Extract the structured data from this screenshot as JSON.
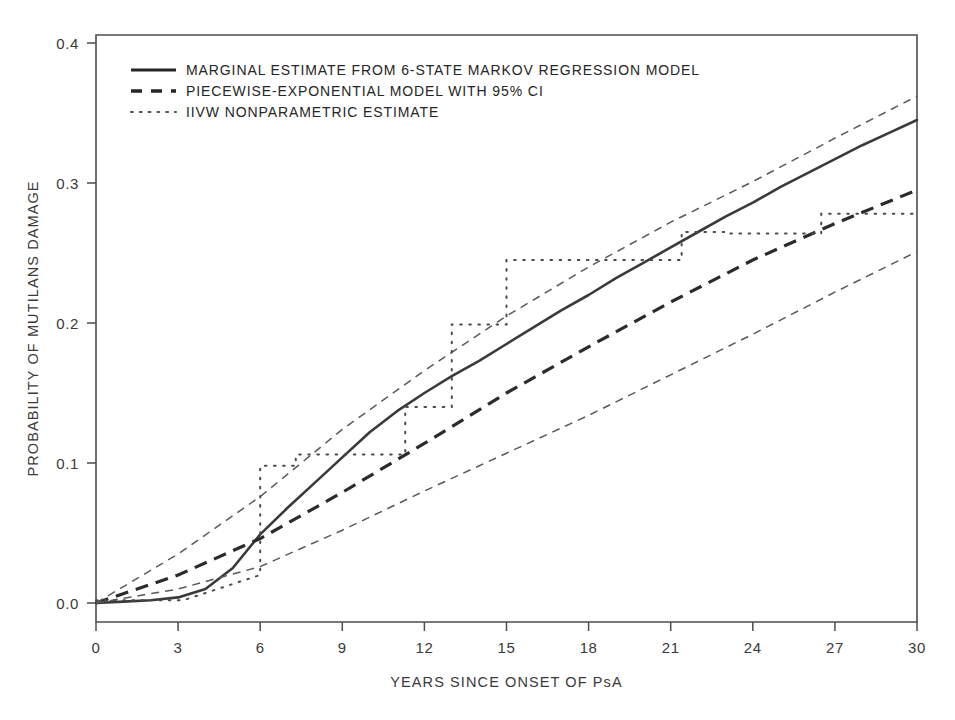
{
  "figure": {
    "background": "#ffffff",
    "frame_color": "#4d4d4d"
  },
  "chart_data": {
    "type": "line",
    "title": "",
    "xlabel": "YEARS SINCE ONSET OF PsA",
    "ylabel": "PROBABILITY OF MUTILANS DAMAGE",
    "xlim": [
      0,
      30
    ],
    "ylim": [
      0.0,
      0.4
    ],
    "xticks": [
      0,
      3,
      6,
      9,
      12,
      15,
      18,
      21,
      24,
      27,
      30
    ],
    "xticklabels": [
      "0",
      "3",
      "6",
      "9",
      "12",
      "15",
      "18",
      "21",
      "24",
      "27",
      "30"
    ],
    "yticks": [
      0.0,
      0.1,
      0.2,
      0.3,
      0.4
    ],
    "yticklabels": [
      "0.0",
      "0.1",
      "0.2",
      "0.3",
      "0.4"
    ],
    "grid": false,
    "legend_position": "upper-left",
    "series": [
      {
        "name": "MARGINAL ESTIMATE FROM 6-STATE MARKOV REGRESSION MODEL",
        "style": "solid",
        "color": "#3a3a3a",
        "x": [
          0,
          1,
          2,
          3,
          4,
          5,
          6,
          7,
          8,
          9,
          10,
          11,
          12,
          13,
          14,
          15,
          16,
          17,
          18,
          19,
          20,
          21,
          22,
          23,
          24,
          25,
          26,
          27,
          28,
          29,
          30
        ],
        "y": [
          0.0,
          0.001,
          0.002,
          0.004,
          0.01,
          0.025,
          0.049,
          0.068,
          0.086,
          0.104,
          0.122,
          0.137,
          0.15,
          0.162,
          0.173,
          0.185,
          0.197,
          0.209,
          0.22,
          0.232,
          0.243,
          0.254,
          0.265,
          0.276,
          0.286,
          0.297,
          0.307,
          0.317,
          0.327,
          0.336,
          0.345
        ]
      },
      {
        "name": "PIECEWISE-EXPONENTIAL MODEL WITH 95% CI",
        "style": "dashed",
        "color": "#2b2b2b",
        "x": [
          0,
          3,
          6,
          9,
          12,
          15,
          18,
          21,
          24,
          27,
          30
        ],
        "y": [
          0.0,
          0.02,
          0.046,
          0.079,
          0.114,
          0.15,
          0.183,
          0.215,
          0.245,
          0.271,
          0.295
        ]
      },
      {
        "name": "PIECEWISE-EXPONENTIAL MODEL 95% CI UPPER",
        "style": "dashed-thin",
        "color": "#5a5a5a",
        "x": [
          0,
          3,
          6,
          9,
          12,
          15,
          18,
          21,
          24,
          27,
          30
        ],
        "y": [
          0.0,
          0.035,
          0.076,
          0.124,
          0.166,
          0.205,
          0.24,
          0.272,
          0.301,
          0.332,
          0.362
        ]
      },
      {
        "name": "PIECEWISE-EXPONENTIAL MODEL 95% CI LOWER",
        "style": "dashed-thin",
        "color": "#5a5a5a",
        "x": [
          0,
          3,
          6,
          9,
          12,
          15,
          18,
          21,
          24,
          27,
          30
        ],
        "y": [
          0.0,
          0.01,
          0.026,
          0.052,
          0.08,
          0.107,
          0.134,
          0.163,
          0.192,
          0.222,
          0.251
        ]
      },
      {
        "name": "IIVW NONPARAMETRIC ESTIMATE",
        "style": "dotted-step",
        "color": "#4a4a4a",
        "x": [
          0.0,
          3.2,
          6.0,
          6.0,
          7.3,
          7.3,
          11.3,
          11.3,
          13.0,
          13.0,
          15.0,
          15.0,
          21.4,
          21.4,
          23.0,
          23.0,
          26.5,
          26.5,
          30.0
        ],
        "y": [
          0.002,
          0.002,
          0.02,
          0.098,
          0.098,
          0.106,
          0.106,
          0.14,
          0.14,
          0.199,
          0.199,
          0.245,
          0.245,
          0.265,
          0.265,
          0.264,
          0.264,
          0.278,
          0.278
        ]
      }
    ],
    "legend_entries": [
      {
        "label": "MARGINAL ESTIMATE FROM 6-STATE MARKOV REGRESSION MODEL",
        "style": "solid"
      },
      {
        "label": "PIECEWISE-EXPONENTIAL MODEL WITH 95% CI",
        "style": "dashed"
      },
      {
        "label": "IIVW NONPARAMETRIC ESTIMATE",
        "style": "dotted"
      }
    ]
  }
}
